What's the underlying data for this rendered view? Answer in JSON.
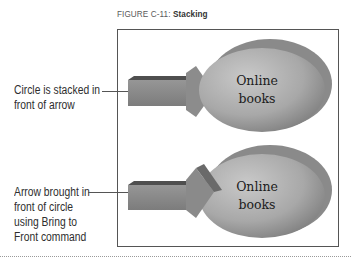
{
  "figure": {
    "label": "FIGURE C-11:",
    "title": "Stacking"
  },
  "callouts": [
    {
      "lines": [
        "Circle is stacked in",
        "front of arrow"
      ]
    },
    {
      "lines": [
        "Arrow brought in",
        "front of circle",
        "using Bring to",
        "Front command"
      ]
    }
  ],
  "examples": [
    {
      "shape_text": [
        "Online",
        "books"
      ],
      "stacking": "circle-in-front"
    },
    {
      "shape_text": [
        "Online",
        "books"
      ],
      "stacking": "arrow-in-front"
    }
  ],
  "colors": {
    "frame_border": "#555555",
    "circle_fill": "#a9a9a9",
    "circle_shadow": "#6f6f6f",
    "arrow_fill": "#8a8a8a",
    "arrow_top": "#555555"
  }
}
